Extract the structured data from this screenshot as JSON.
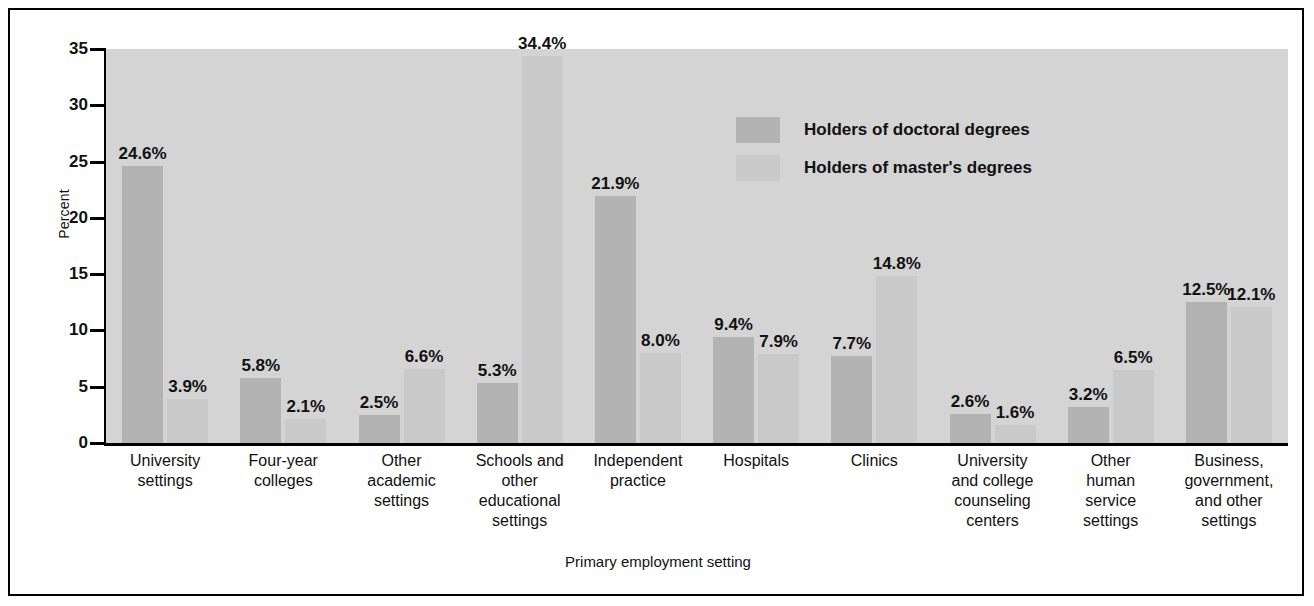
{
  "chart_data": {
    "type": "bar",
    "title": "",
    "xlabel": "Primary employment setting",
    "ylabel": "Percent",
    "ylim": [
      0,
      35
    ],
    "yticks": [
      "0",
      "5",
      "10",
      "15",
      "20",
      "25",
      "30",
      "35"
    ],
    "grid": false,
    "legend_position": "top-center-right",
    "categories": [
      "University settings",
      "Four-year colleges",
      "Other academic settings",
      "Schools and other educational settings",
      "Independent practice",
      "Hospitals",
      "Clinics",
      "University and college counseling centers",
      "Other human service settings",
      "Business, government, and other settings"
    ],
    "category_lines": [
      [
        "University",
        "settings"
      ],
      [
        "Four-year",
        "colleges"
      ],
      [
        "Other",
        "academic",
        "settings"
      ],
      [
        "Schools and",
        "other",
        "educational",
        "settings"
      ],
      [
        "Independent",
        "practice"
      ],
      [
        "Hospitals"
      ],
      [
        "Clinics"
      ],
      [
        "University",
        "and college",
        "counseling",
        "centers"
      ],
      [
        "Other",
        "human",
        "service",
        "settings"
      ],
      [
        "Business,",
        "government,",
        "and other",
        "settings"
      ]
    ],
    "series": [
      {
        "name": "Holders of doctoral degrees",
        "color": "#b3b3b3",
        "values": [
          24.6,
          5.8,
          2.5,
          5.3,
          21.9,
          9.4,
          7.7,
          2.6,
          3.2,
          12.5
        ],
        "labels": [
          "24.6%",
          "5.8%",
          "2.5%",
          "5.3%",
          "21.9%",
          "9.4%",
          "7.7%",
          "2.6%",
          "3.2%",
          "12.5%"
        ]
      },
      {
        "name": "Holders of master's degrees",
        "color": "#c9c9c9",
        "values": [
          3.9,
          2.1,
          6.6,
          34.4,
          8.0,
          7.9,
          14.8,
          1.6,
          6.5,
          12.1
        ],
        "labels": [
          "3.9%",
          "2.1%",
          "6.6%",
          "34.4%",
          "8.0%",
          "7.9%",
          "14.8%",
          "1.6%",
          "6.5%",
          "12.1%"
        ]
      }
    ]
  },
  "legend": {
    "items": [
      {
        "label": "Holders of doctoral degrees",
        "color": "#b3b3b3"
      },
      {
        "label": "Holders of master's degrees",
        "color": "#c9c9c9"
      }
    ]
  },
  "colors": {
    "plot_background": "#d4d4d4",
    "page_background": "#ffffff",
    "frame": "#000000",
    "doctoral": "#b3b3b3",
    "masters": "#c9c9c9",
    "text": "#111111"
  }
}
